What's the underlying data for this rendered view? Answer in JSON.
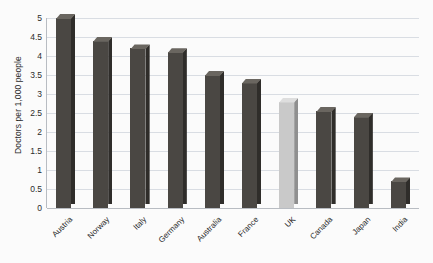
{
  "chart_data": {
    "type": "bar",
    "title": "",
    "xlabel": "",
    "ylabel": "Doctors per 1,000 people",
    "ylim": [
      0,
      5
    ],
    "ytick_labels": [
      "5",
      "4.5",
      "4",
      "3.5",
      "3",
      "2.5",
      "2",
      "1.5",
      "1",
      "0.5",
      "0"
    ],
    "ytick_values": [
      5,
      4.5,
      4,
      3.5,
      3,
      2.5,
      2,
      1.5,
      1,
      0.5,
      0
    ],
    "grid": true,
    "legend": "none",
    "categories": [
      "Austria",
      "Norway",
      "Italy",
      "Germany",
      "Australia",
      "France",
      "UK",
      "Canada",
      "Japan",
      "India"
    ],
    "values": [
      5.0,
      4.4,
      4.2,
      4.1,
      3.5,
      3.3,
      2.8,
      2.55,
      2.4,
      0.7
    ],
    "highlight_category": "UK",
    "colors": {
      "bar_face": "#4a4743",
      "bar_side": "#2f2d2a",
      "bar_top": "#6a6660",
      "highlight_face": "#c9c9c9",
      "highlight_side": "#8f8f8f",
      "highlight_top": "#dedede",
      "gridline": "#d9dde3",
      "axis": "#b8bcc2",
      "background": "#fbfbfb",
      "text": "#1f1f1f"
    }
  }
}
